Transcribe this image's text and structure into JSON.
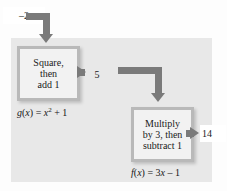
{
  "diagram": {
    "colors": {
      "panel_background": "#e8e8e8",
      "box_border": "#b9b9b9",
      "box_fill": "#f2f2f2",
      "arrow": "#7a7a7a",
      "text": "#1a1a1a",
      "page_background": "#fdfdfd"
    }
  },
  "values": {
    "input": "–2",
    "intermediate": "5",
    "output": "14"
  },
  "boxes": [
    {
      "id": "g",
      "line1": "Square,",
      "line2": "then",
      "line3": "add 1"
    },
    {
      "id": "f",
      "line1": "Multiply",
      "line2": "by 3, then",
      "line3": "subtract 1"
    }
  ],
  "formulas": {
    "g": {
      "name": "g",
      "open": "(",
      "arg": "x",
      "close": ")",
      "equals": " = ",
      "base": "x",
      "exponent": "2",
      "tail": " + 1"
    },
    "f": {
      "name": "f",
      "open": "(",
      "arg": "x",
      "close": ")",
      "equals": " = 3",
      "base": "x",
      "tail": " – 1"
    }
  },
  "arrows": [
    {
      "id": "input-to-g",
      "label": "arrow from input value into square-then-add-one box"
    },
    {
      "id": "g-to-value",
      "label": "arrow from square-then-add-one box to intermediate value"
    },
    {
      "id": "value-to-f",
      "label": "arrow from intermediate value into multiply-by-three box"
    },
    {
      "id": "f-to-output",
      "label": "arrow from multiply-by-three box to output value"
    }
  ]
}
